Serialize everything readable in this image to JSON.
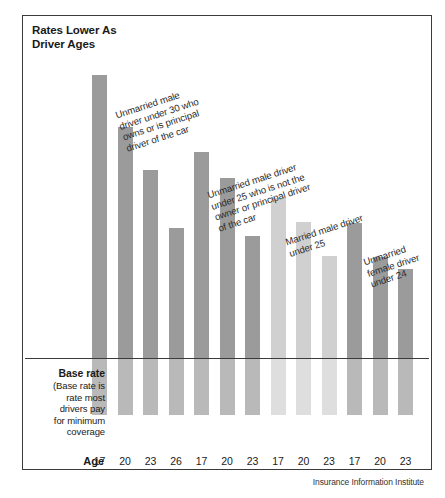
{
  "chart": {
    "title_line1": "Rates Lower As",
    "title_line2": "Driver Ages",
    "age_axis_label": "Age",
    "source": "Insurance Information Institute",
    "baserate_heading": "Base rate",
    "baserate_body": "(Base rate is\nrate most\ndrivers pay\nfor minimum\ncoverage"
  },
  "chart_data": {
    "type": "bar",
    "title": "Rates Lower As Driver Ages",
    "xlabel": "Age",
    "ylabel": "",
    "grid": false,
    "legend": "annotations",
    "note": "Bar heights are relative insurance rate index; horizontal line marks the base rate.",
    "baseline_label": "Base rate",
    "baseline_value": 100,
    "ylim": [
      0,
      400
    ],
    "categories": [
      "17",
      "20",
      "23",
      "26",
      "17",
      "20",
      "23",
      "17",
      "20",
      "23",
      "17",
      "20",
      "23"
    ],
    "values": [
      379,
      245,
      133,
      97,
      169,
      141,
      87,
      117,
      86,
      68,
      116,
      67,
      58
    ],
    "bar_shades": [
      "dark",
      "dark",
      "dark",
      "dark",
      "dark",
      "dark",
      "dark",
      "light",
      "light",
      "light",
      "dark",
      "dark",
      "dark"
    ],
    "groups": [
      {
        "label": "Unmarried male\ndriver under 30 who\nowns or is principal\ndriver of the car",
        "bars": [
          0,
          1,
          2,
          3
        ]
      },
      {
        "label": "Unmarried male driver\nunder 25 who is not the\nowner or principal driver\nof the car",
        "bars": [
          4,
          5,
          6
        ]
      },
      {
        "label": "Married male driver\nunder 25",
        "bars": [
          7,
          8,
          9
        ]
      },
      {
        "label": "Unmarried\nfemale driver\nunder 24",
        "bars": [
          10,
          11,
          12
        ]
      }
    ],
    "colors": {
      "bar_dark_above": "#9b9b9b",
      "bar_light_above": "#d0d0d0",
      "bar_dark_below": "#b9b9b9",
      "bar_light_below": "#dedede",
      "frame": "#3b3b3b",
      "text": "#1a1a1a"
    }
  },
  "layout": {
    "bar_x": [
      70,
      95.5,
      121,
      146.5,
      172,
      197.5,
      223,
      248.5,
      274,
      299.5,
      325,
      350.5,
      376
    ],
    "bar_top": [
      60,
      112,
      155,
      213,
      137,
      163,
      221,
      183,
      207,
      241,
      208,
      242,
      254
    ],
    "baseline_top": 343,
    "bar_bottom": 55,
    "annotations": [
      {
        "x": 92,
        "y": 95,
        "rot": -18
      },
      {
        "x": 184,
        "y": 175,
        "rot": -18
      },
      {
        "x": 262,
        "y": 222,
        "rot": -18
      },
      {
        "x": 340,
        "y": 242,
        "rot": -18
      }
    ]
  }
}
